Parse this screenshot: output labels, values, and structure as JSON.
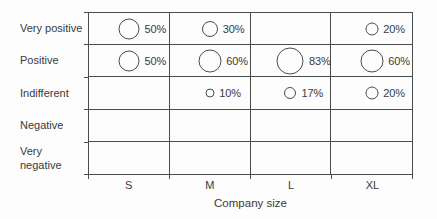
{
  "chart_data": {
    "type": "scatter",
    "variant": "bubble-matrix",
    "title": "",
    "xlabel": "Company size",
    "ylabel": "",
    "columns": [
      "S",
      "M",
      "L",
      "XL"
    ],
    "rows": [
      "Very positive",
      "Positive",
      "Indifferent",
      "Negative",
      "Very\nnegative"
    ],
    "values": [
      [
        50,
        30,
        null,
        20
      ],
      [
        50,
        60,
        83,
        60
      ],
      [
        null,
        10,
        17,
        20
      ],
      [
        null,
        null,
        null,
        null
      ],
      [
        null,
        null,
        null,
        null
      ]
    ],
    "value_suffix": "%",
    "legend": "none",
    "grid": "on",
    "bubble_sizing": "diameter proportional to sqrt(value)"
  },
  "colors": {
    "line": "#4c4c4c",
    "text": "#3a3a3a",
    "background": "#fdfdfd"
  }
}
